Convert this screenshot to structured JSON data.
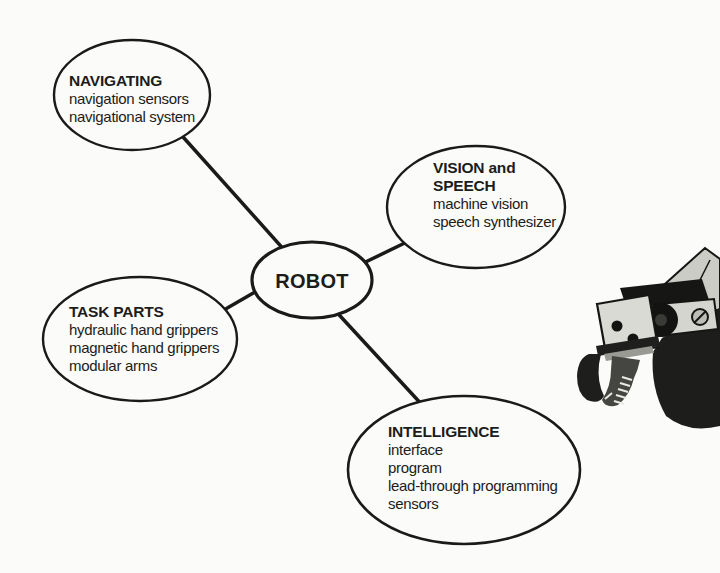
{
  "diagram": {
    "center": {
      "label": "ROBOT"
    },
    "nodes": [
      {
        "id": "navigating",
        "title": "NAVIGATING",
        "items": [
          "navigation sensors",
          "navigational system"
        ]
      },
      {
        "id": "vision-speech",
        "title": "VISION and SPEECH",
        "title_line1": "VISION and",
        "title_line2": "SPEECH",
        "items": [
          "machine vision",
          "speech synthesizer"
        ]
      },
      {
        "id": "task-parts",
        "title": "TASK PARTS",
        "items": [
          "hydraulic hand grippers",
          "magnetic hand grippers",
          "modular arms"
        ]
      },
      {
        "id": "intelligence",
        "title": "INTELLIGENCE",
        "items": [
          "interface",
          "program",
          "lead-through programming",
          "sensors"
        ]
      }
    ],
    "illustration": {
      "name": "robot-gripper-photo"
    },
    "colors": {
      "ink": "#1a1a1a",
      "paper": "#fbfbf9"
    }
  }
}
